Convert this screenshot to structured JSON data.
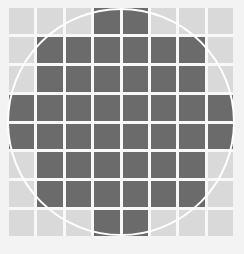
{
  "diagram": {
    "type": "pixel-grid-circle",
    "rows": 8,
    "cols": 8,
    "colors": {
      "dark": "#6b6b6b",
      "light": "#d9d9d9",
      "background": "#f3f3f3",
      "circle": "#ffffff"
    },
    "pattern": [
      [
        0,
        0,
        0,
        1,
        1,
        0,
        0,
        0
      ],
      [
        0,
        1,
        1,
        1,
        1,
        1,
        1,
        0
      ],
      [
        0,
        1,
        1,
        1,
        1,
        1,
        1,
        0
      ],
      [
        1,
        1,
        1,
        1,
        1,
        1,
        1,
        1
      ],
      [
        1,
        1,
        1,
        1,
        1,
        1,
        1,
        1
      ],
      [
        0,
        1,
        1,
        1,
        1,
        1,
        1,
        0
      ],
      [
        0,
        1,
        1,
        1,
        1,
        1,
        1,
        0
      ],
      [
        0,
        0,
        0,
        1,
        1,
        0,
        0,
        0
      ]
    ],
    "circle": {
      "cx": 121,
      "cy": 122,
      "r": 113
    }
  }
}
